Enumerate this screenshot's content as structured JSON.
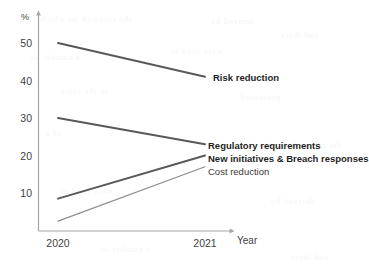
{
  "chart_data": {
    "type": "line",
    "title": "",
    "xlabel": "Year",
    "ylabel": "%",
    "x": [
      "2020",
      "2021"
    ],
    "xtick_labels": [
      "2020",
      "2021"
    ],
    "ytick_labels": [
      "10",
      "20",
      "30",
      "40",
      "50"
    ],
    "yticks": [
      10,
      20,
      30,
      40,
      50
    ],
    "ylim": [
      0,
      55
    ],
    "grid": false,
    "legend": "inline-right-labels",
    "series": [
      {
        "name": "Risk reduction",
        "values": [
          50,
          41
        ],
        "emphasis": "bold",
        "color": "#595959"
      },
      {
        "name": "Regulatory requirements",
        "values": [
          30,
          23
        ],
        "emphasis": "bold",
        "color": "#595959"
      },
      {
        "name": "New initiatives & Breach responses",
        "values": [
          8.5,
          20
        ],
        "emphasis": "bold",
        "color": "#595959"
      },
      {
        "name": "Cost reduction",
        "values": [
          2.5,
          17
        ],
        "emphasis": "plain",
        "color": "#8c8c8c"
      }
    ]
  },
  "axes": {
    "y_unit_label": "%",
    "x_axis_title": "Year",
    "y_ticks": [
      "50",
      "40",
      "30",
      "20",
      "10"
    ],
    "x_ticks": [
      "2020",
      "2021"
    ]
  },
  "labels": {
    "risk_reduction": "Risk reduction",
    "regulatory_requirements": "Regulatory requirements",
    "new_initiatives": "New initiatives & Breach responses",
    "cost_reduction": "Cost reduction"
  },
  "colors": {
    "line_dark": "#595959",
    "line_light": "#8c8c8c",
    "axis": "#a6a6a6",
    "text": "#3f3f3f",
    "background": "#ffffff"
  },
  "bleed_text": [
    "the research on which",
    "a number of",
    "derived by",
    "in the same",
    "were used to",
    "and there",
    "of a",
    "presented"
  ]
}
